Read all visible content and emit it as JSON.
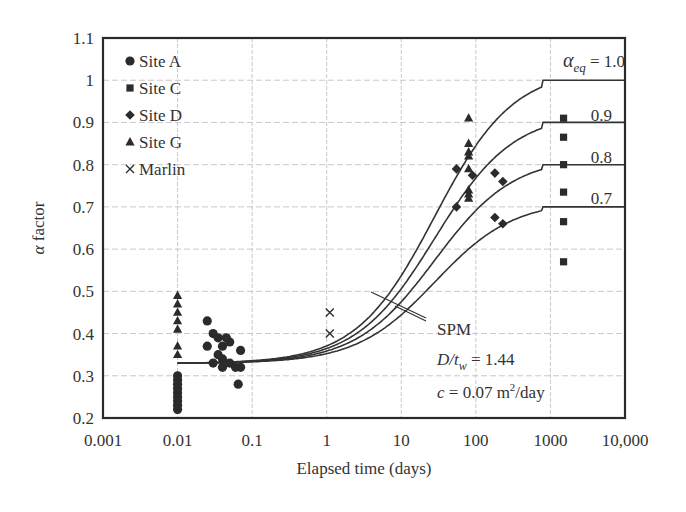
{
  "chart_data": {
    "type": "scatter",
    "title": "",
    "xlabel": "Elapsed time (days)",
    "ylabel": "α factor",
    "xscale": "log",
    "xlim": [
      0.001,
      10000
    ],
    "ylim": [
      0.2,
      1.1
    ],
    "grid": true,
    "legend_position": "upper-left",
    "x_ticks": [
      {
        "value": 0.001,
        "label": "0.001"
      },
      {
        "value": 0.01,
        "label": "0.01"
      },
      {
        "value": 0.1,
        "label": "0.1"
      },
      {
        "value": 1,
        "label": "1"
      },
      {
        "value": 10,
        "label": "10"
      },
      {
        "value": 100,
        "label": "100"
      },
      {
        "value": 1000,
        "label": "1000"
      },
      {
        "value": 10000,
        "label": "10,000"
      }
    ],
    "y_ticks": [
      {
        "value": 0.2,
        "label": "0.2"
      },
      {
        "value": 0.3,
        "label": "0.3"
      },
      {
        "value": 0.4,
        "label": "0.4"
      },
      {
        "value": 0.5,
        "label": "0.5"
      },
      {
        "value": 0.6,
        "label": "0.6"
      },
      {
        "value": 0.7,
        "label": "0.7"
      },
      {
        "value": 0.8,
        "label": "0.8"
      },
      {
        "value": 0.9,
        "label": "0.9"
      },
      {
        "value": 1.0,
        "label": "1"
      },
      {
        "value": 1.1,
        "label": "1.1"
      }
    ],
    "series": [
      {
        "name": "Site A",
        "marker": "circle",
        "points": [
          [
            0.01,
            0.22
          ],
          [
            0.01,
            0.23
          ],
          [
            0.01,
            0.24
          ],
          [
            0.01,
            0.25
          ],
          [
            0.01,
            0.26
          ],
          [
            0.01,
            0.27
          ],
          [
            0.01,
            0.28
          ],
          [
            0.01,
            0.29
          ],
          [
            0.01,
            0.3
          ],
          [
            0.025,
            0.43
          ],
          [
            0.03,
            0.4
          ],
          [
            0.035,
            0.39
          ],
          [
            0.04,
            0.37
          ],
          [
            0.045,
            0.39
          ],
          [
            0.05,
            0.38
          ],
          [
            0.025,
            0.37
          ],
          [
            0.035,
            0.35
          ],
          [
            0.04,
            0.34
          ],
          [
            0.03,
            0.33
          ],
          [
            0.04,
            0.32
          ],
          [
            0.05,
            0.33
          ],
          [
            0.06,
            0.32
          ],
          [
            0.07,
            0.36
          ],
          [
            0.07,
            0.32
          ],
          [
            0.065,
            0.28
          ]
        ]
      },
      {
        "name": "Site C",
        "marker": "square",
        "points": [
          [
            1500,
            0.91
          ],
          [
            1500,
            0.865
          ],
          [
            1500,
            0.8
          ],
          [
            1500,
            0.735
          ],
          [
            1500,
            0.665
          ],
          [
            1500,
            0.57
          ]
        ]
      },
      {
        "name": "Site D",
        "marker": "diamond",
        "points": [
          [
            55,
            0.79
          ],
          [
            55,
            0.7
          ],
          [
            90,
            0.775
          ],
          [
            180,
            0.78
          ],
          [
            230,
            0.76
          ],
          [
            180,
            0.675
          ],
          [
            230,
            0.66
          ]
        ]
      },
      {
        "name": "Site G",
        "marker": "triangle",
        "points": [
          [
            0.01,
            0.49
          ],
          [
            0.01,
            0.47
          ],
          [
            0.01,
            0.45
          ],
          [
            0.01,
            0.43
          ],
          [
            0.01,
            0.41
          ],
          [
            0.01,
            0.37
          ],
          [
            0.01,
            0.35
          ],
          [
            80,
            0.91
          ],
          [
            80,
            0.85
          ],
          [
            80,
            0.83
          ],
          [
            80,
            0.82
          ],
          [
            80,
            0.79
          ],
          [
            80,
            0.74
          ],
          [
            80,
            0.73
          ],
          [
            80,
            0.72
          ]
        ]
      },
      {
        "name": "Marlin",
        "marker": "x",
        "points": [
          [
            1.1,
            0.45
          ],
          [
            1.1,
            0.4
          ]
        ]
      }
    ],
    "curves": [
      {
        "name": "SPM α_eq = 1.0",
        "alpha_eq": 1.0,
        "label": "α_eq = 1.0"
      },
      {
        "name": "SPM α_eq = 0.9",
        "alpha_eq": 0.9,
        "label": "0.9"
      },
      {
        "name": "SPM α_eq = 0.8",
        "alpha_eq": 0.8,
        "label": "0.8"
      },
      {
        "name": "SPM α_eq = 0.7",
        "alpha_eq": 0.7,
        "label": "0.7"
      }
    ],
    "curve_start": {
      "t": 0.01,
      "alpha": 0.33
    },
    "annotations": {
      "spm": "SPM",
      "dtw": "D/t",
      "dtw_sub": "w",
      "dtw_val": " = 1.44",
      "c_pre": "c",
      "c_val": " = 0.07 m",
      "c_sup": "2",
      "c_post": "/day",
      "alpha_eq_sym": "α",
      "alpha_eq_sub": "eq",
      "alpha_eq_val": " = 1.0",
      "alpha_eq_09": "0.9",
      "alpha_eq_08": "0.8",
      "alpha_eq_07": "0.7"
    }
  }
}
